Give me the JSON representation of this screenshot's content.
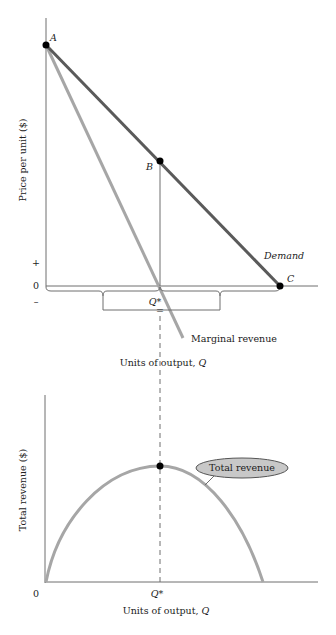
{
  "top_panel": {
    "ylabel": "Price per unit ($)",
    "xlabel_prefix": "Units of output, ",
    "xlabel_var": "Q",
    "sign_plus": "+",
    "sign_zero": "0",
    "sign_minus": "–",
    "point_a": "A",
    "point_b": "B",
    "point_c": "C",
    "demand_label": "Demand",
    "mr_label": "Marginal revenue",
    "qstar_label": "Q*",
    "equals_label": "="
  },
  "bottom_panel": {
    "ylabel": "Total revenue ($)",
    "xlabel_prefix": "Units of output, ",
    "xlabel_var": "Q",
    "origin_label": "0",
    "qstar_label": "Q*",
    "tr_label": "Total revenue"
  },
  "colors": {
    "demand": "#5a5a5a",
    "marginal_revenue": "#a6a6a6",
    "total_revenue": "#a6a6a6",
    "axis": "#6e6e6e",
    "ellipse_fill": "#c8c8c8"
  }
}
